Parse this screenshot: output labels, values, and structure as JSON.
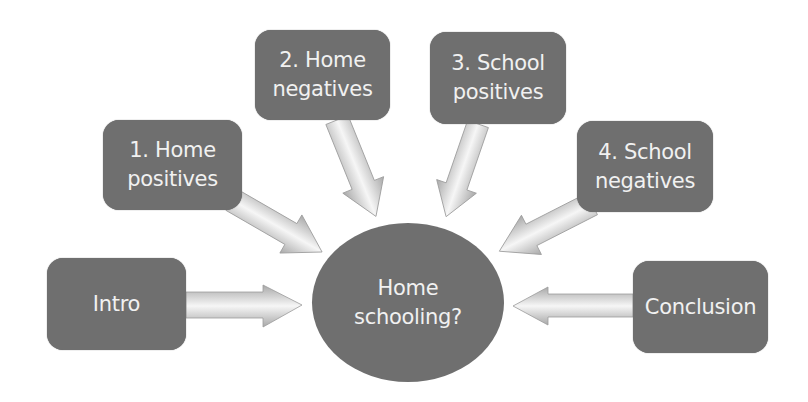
{
  "colors": {
    "node_fill": "#6f6f6f",
    "node_text": "#f1f1f1",
    "arrow_light": "#f4f4f4",
    "arrow_dark": "#9a9a9a",
    "background": "#ffffff"
  },
  "center": {
    "lines": [
      "Home",
      "schooling?"
    ]
  },
  "nodes": [
    {
      "id": "intro",
      "lines": [
        "Intro"
      ]
    },
    {
      "id": "home-positives",
      "lines": [
        "1. Home",
        "positives"
      ]
    },
    {
      "id": "home-negatives",
      "lines": [
        "2. Home",
        "negatives"
      ]
    },
    {
      "id": "school-positives",
      "lines": [
        "3. School",
        "positives"
      ]
    },
    {
      "id": "school-negatives",
      "lines": [
        "4. School",
        "negatives"
      ]
    },
    {
      "id": "conclusion",
      "lines": [
        "Conclusion"
      ]
    }
  ],
  "edges": [
    {
      "from": "intro",
      "to": "center"
    },
    {
      "from": "home-positives",
      "to": "center"
    },
    {
      "from": "home-negatives",
      "to": "center"
    },
    {
      "from": "school-positives",
      "to": "center"
    },
    {
      "from": "school-negatives",
      "to": "center"
    },
    {
      "from": "conclusion",
      "to": "center"
    }
  ]
}
